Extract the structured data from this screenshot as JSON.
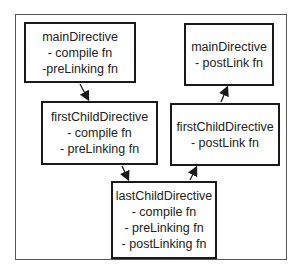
{
  "diagram": {
    "nodes": [
      {
        "id": "main-pre",
        "lines": [
          "mainDirective",
          "- compile fn",
          "-preLinking fn"
        ]
      },
      {
        "id": "first-pre",
        "lines": [
          "firstChildDirective",
          "- compile fn",
          "- preLinking fn"
        ]
      },
      {
        "id": "last",
        "lines": [
          "lastChildDirective",
          "- compile fn",
          "- preLinking fn",
          "- postLinking fn"
        ]
      },
      {
        "id": "first-post",
        "lines": [
          "firstChildDirective",
          "- postLink fn"
        ]
      },
      {
        "id": "main-post",
        "lines": [
          "mainDirective",
          "- postLink fn"
        ]
      }
    ],
    "edges": [
      {
        "from": "main-pre",
        "to": "first-pre"
      },
      {
        "from": "first-pre",
        "to": "last"
      },
      {
        "from": "last",
        "to": "first-post"
      },
      {
        "from": "first-post",
        "to": "main-post"
      }
    ]
  }
}
